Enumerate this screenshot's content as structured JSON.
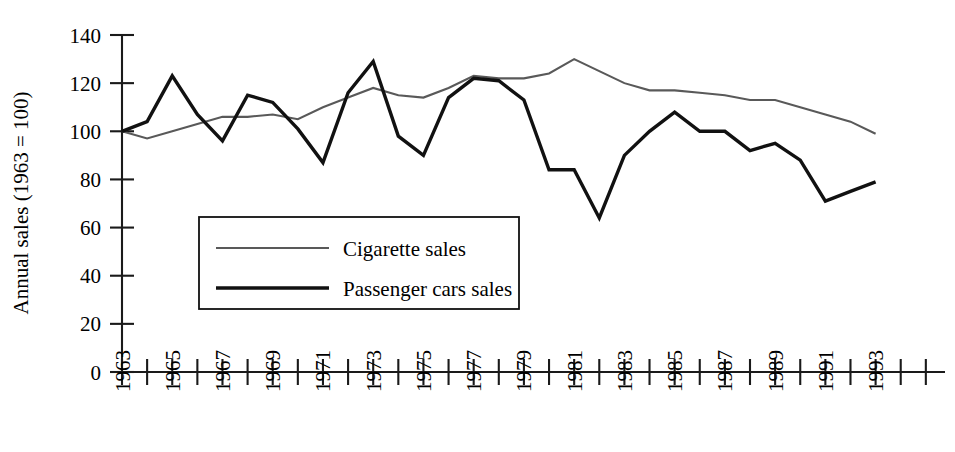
{
  "chart_data": {
    "type": "line",
    "title": "",
    "subtitle": "",
    "xlabel": "",
    "ylabel": "Annual sales (1963 = 100)",
    "xlim": [
      1963,
      1995
    ],
    "ylim": [
      0,
      140
    ],
    "grid": false,
    "legend_position": "inside-left-lower",
    "x": [
      1963,
      1964,
      1965,
      1966,
      1967,
      1968,
      1969,
      1970,
      1971,
      1972,
      1973,
      1974,
      1975,
      1976,
      1977,
      1978,
      1979,
      1980,
      1981,
      1982,
      1983,
      1984,
      1985,
      1986,
      1987,
      1988,
      1989,
      1990,
      1991,
      1992,
      1993
    ],
    "xtick_values": [
      1963,
      1964,
      1965,
      1966,
      1967,
      1968,
      1969,
      1970,
      1971,
      1972,
      1973,
      1974,
      1975,
      1976,
      1977,
      1978,
      1979,
      1980,
      1981,
      1982,
      1983,
      1984,
      1985,
      1986,
      1987,
      1988,
      1989,
      1990,
      1991,
      1992,
      1993,
      1994,
      1995
    ],
    "xtick_labels": [
      "1963",
      "1965",
      "1967",
      "1969",
      "1971",
      "1973",
      "1975",
      "1977",
      "1979",
      "1981",
      "1983",
      "1985",
      "1987",
      "1989",
      "1991",
      "1993"
    ],
    "xtick_label_values": [
      1963,
      1965,
      1967,
      1969,
      1971,
      1973,
      1975,
      1977,
      1979,
      1981,
      1983,
      1985,
      1987,
      1989,
      1991,
      1993
    ],
    "ytick_values": [
      0,
      20,
      40,
      60,
      80,
      100,
      120,
      140
    ],
    "ytick_labels": [
      "0",
      "20",
      "40",
      "60",
      "80",
      "100",
      "120",
      "140"
    ],
    "series": [
      {
        "name": "Cigarette sales",
        "color": "#595959",
        "width": 2.1,
        "values": [
          100,
          97,
          100,
          103,
          106,
          106,
          107,
          105,
          110,
          114,
          118,
          115,
          114,
          118,
          123,
          122,
          122,
          124,
          130,
          125,
          120,
          117,
          117,
          116,
          115,
          113,
          113,
          110,
          107,
          104,
          99
        ]
      },
      {
        "name": "Passenger cars sales",
        "color": "#111111",
        "width": 3.4,
        "values": [
          100,
          104,
          123,
          107,
          96,
          115,
          112,
          101,
          87,
          116,
          129,
          98,
          90,
          114,
          122,
          121,
          113,
          84,
          84,
          64,
          90,
          100,
          108,
          100,
          100,
          92,
          95,
          88,
          71,
          75,
          79
        ]
      }
    ]
  },
  "legend": {
    "entries": [
      {
        "label": "Cigarette sales"
      },
      {
        "label": "Passenger cars sales"
      }
    ]
  },
  "axes": {
    "y_axis_title": "Annual sales (1963 = 100)"
  }
}
